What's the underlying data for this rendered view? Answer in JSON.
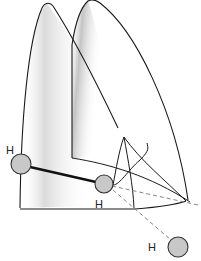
{
  "diagram": {
    "type": "orbital-overlap",
    "labels": {
      "h_left": "H",
      "h_center": "H",
      "h_bottom": "H"
    },
    "colors": {
      "stroke": "#1a1a1a",
      "atom_fill": "#c8c8c8",
      "shade": "#9a9a9a",
      "dashed": "#777777"
    },
    "atoms": [
      {
        "label": "H",
        "cx": 21,
        "cy": 164,
        "r": 10
      },
      {
        "label": "H",
        "cx": 104,
        "cy": 184,
        "r": 9
      },
      {
        "label": "H",
        "cx": 178,
        "cy": 247,
        "r": 10
      }
    ]
  }
}
